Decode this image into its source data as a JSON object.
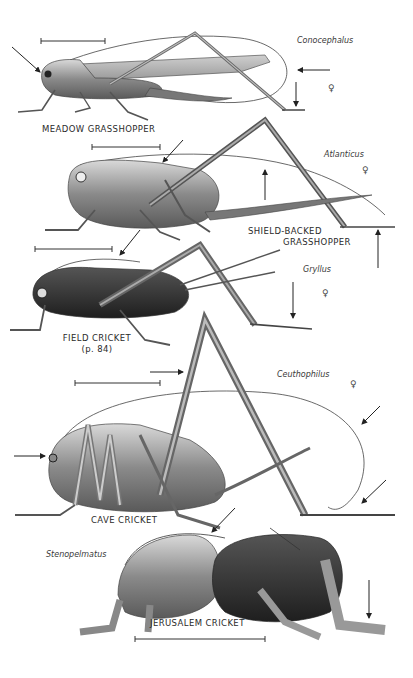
{
  "plate": {
    "background": "#ffffff",
    "ink_color": "#2a2a2a",
    "specimens": [
      {
        "common_name": "MEADOW GRASSHOPPER",
        "genus": "Conocephalus",
        "sex_symbol": "♀"
      },
      {
        "common_name_line1": "SHIELD-BACKED",
        "common_name_line2": "GRASSHOPPER",
        "genus": "Atlanticus",
        "sex_symbol": "♀"
      },
      {
        "common_name": "FIELD CRICKET",
        "page_ref": "(p. 84)",
        "genus": "Gryllus",
        "sex_symbol": "♀"
      },
      {
        "common_name": "CAVE CRICKET",
        "genus": "Ceuthophilus",
        "sex_symbol": "♀"
      },
      {
        "common_name": "JERUSALEM CRICKET",
        "genus": "Stenopelmatus"
      }
    ]
  }
}
